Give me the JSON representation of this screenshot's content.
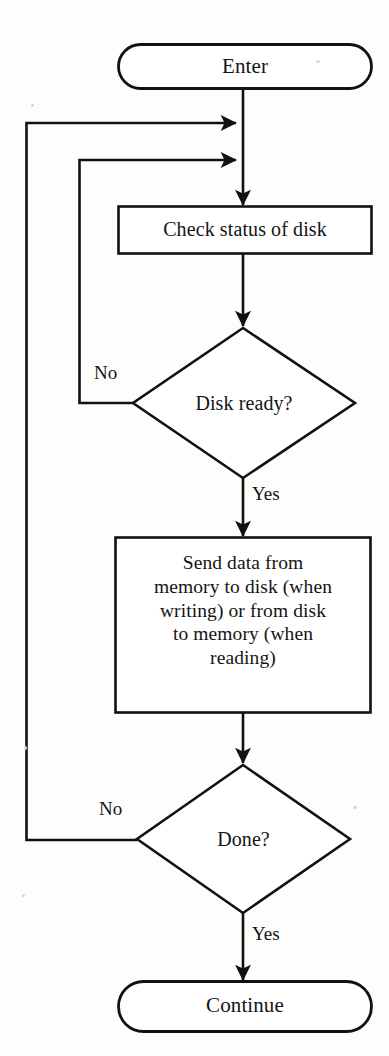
{
  "diagram": {
    "type": "flowchart",
    "orientation": "top-to-bottom",
    "nodes": [
      {
        "id": "enter",
        "shape": "terminator",
        "label": "Enter"
      },
      {
        "id": "check",
        "shape": "process",
        "label": "Check status of disk"
      },
      {
        "id": "ready",
        "shape": "decision",
        "label": "Disk ready?"
      },
      {
        "id": "send",
        "shape": "process",
        "label_lines": [
          "Send data from",
          "memory to disk (when",
          "writing) or from disk",
          "to memory (when",
          "reading)"
        ],
        "label": "Send data from memory to disk (when writing) or from disk to memory (when reading)"
      },
      {
        "id": "done",
        "shape": "decision",
        "label": "Done?"
      },
      {
        "id": "continue",
        "shape": "terminator",
        "label": "Continue"
      }
    ],
    "edges": [
      {
        "from": "enter",
        "to": "check",
        "label": ""
      },
      {
        "from": "check",
        "to": "ready",
        "label": ""
      },
      {
        "from": "ready",
        "to": "check",
        "label": "No",
        "routing": "left-loop-inner"
      },
      {
        "from": "ready",
        "to": "send",
        "label": "Yes",
        "routing": "down"
      },
      {
        "from": "send",
        "to": "done",
        "label": ""
      },
      {
        "from": "done",
        "to": "check",
        "label": "No",
        "routing": "left-loop-outer"
      },
      {
        "from": "done",
        "to": "continue",
        "label": "Yes",
        "routing": "down"
      }
    ],
    "edge_labels": {
      "ready_no": "No",
      "ready_yes": "Yes",
      "done_no": "No",
      "done_yes": "Yes"
    },
    "colors": {
      "stroke": "#111111",
      "fill": "#ffffff",
      "text": "#141414",
      "background": "#fdfdfc"
    }
  }
}
